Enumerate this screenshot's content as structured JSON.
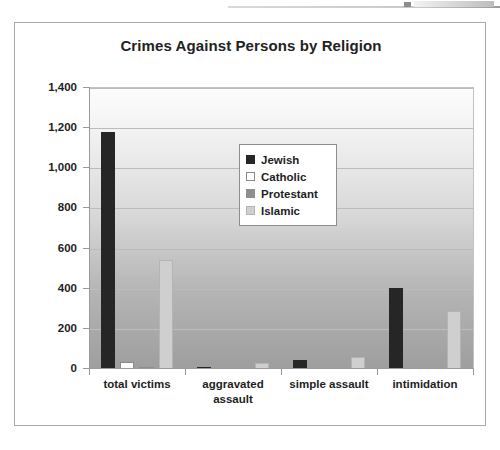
{
  "chart_data": {
    "type": "bar",
    "title": "Crimes Against Persons by Religion",
    "xlabel": "",
    "ylabel": "",
    "ylim": [
      0,
      1400
    ],
    "grid": true,
    "legend_position": "inside-upper-center",
    "categories": [
      "total victims",
      "aggravated assault",
      "simple assault",
      "intimidation"
    ],
    "y_ticks": [
      "0",
      "200",
      "400",
      "600",
      "800",
      "1,000",
      "1,200",
      "1,400"
    ],
    "y_tick_values": [
      0,
      200,
      400,
      600,
      800,
      1000,
      1200,
      1400
    ],
    "series": [
      {
        "name": "Jewish",
        "color": "#262626",
        "values": [
          1180,
          12,
          45,
          405
        ]
      },
      {
        "name": "Catholic",
        "color": "#ffffff",
        "values": [
          35,
          0,
          0,
          0
        ]
      },
      {
        "name": "Protestant",
        "color": "#8e8e8e",
        "values": [
          8,
          0,
          0,
          0
        ]
      },
      {
        "name": "Islamic",
        "color": "#cfcfcf",
        "values": [
          545,
          28,
          62,
          287
        ]
      }
    ]
  },
  "figure": {
    "title": "Crimes Against Persons by Religion"
  },
  "legend": {
    "items": [
      {
        "label": "Jewish"
      },
      {
        "label": "Catholic"
      },
      {
        "label": "Protestant"
      },
      {
        "label": "Islamic"
      }
    ]
  }
}
